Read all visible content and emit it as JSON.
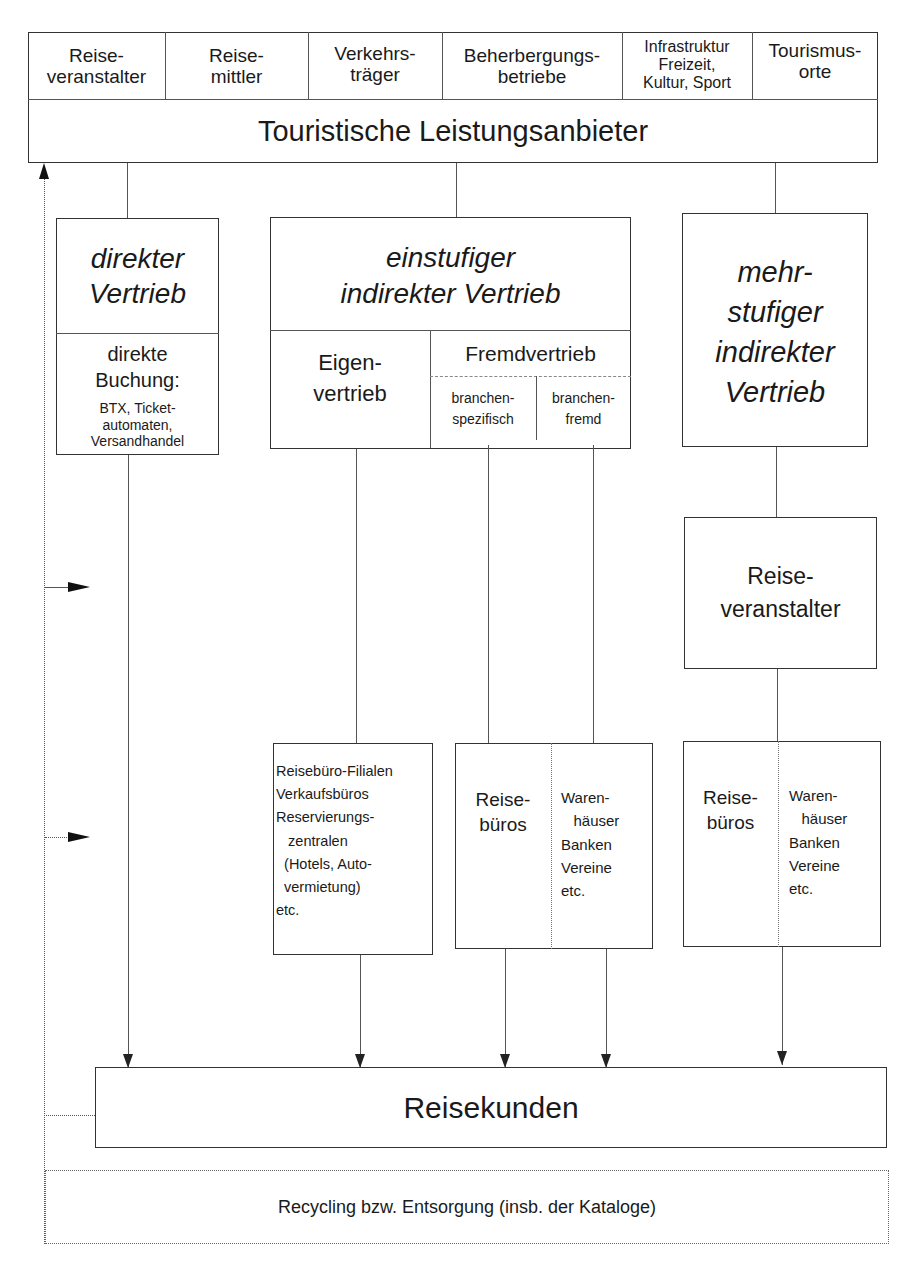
{
  "providers": {
    "title": "Touristische Leistungsanbieter",
    "categories": [
      {
        "label": "Reise-\nveranstalter"
      },
      {
        "label": "Reise-\nmittler"
      },
      {
        "label": "Verkehrs-\nträger"
      },
      {
        "label": "Beherbergungs-\nbetriebe"
      },
      {
        "label": "Infrastruktur\nFreizeit,\nKultur, Sport"
      },
      {
        "label": "Tourismus-\norte"
      }
    ]
  },
  "channels": {
    "direct": {
      "title": "direkter\nVertrieb",
      "subtitle": "direkte\nBuchung:",
      "detail": "BTX, Ticket-\nautomaten,\nVersandhandel"
    },
    "single_stage": {
      "title": "einstufiger\nindirekter Vertrieb",
      "own": "Eigen-\nvertrieb",
      "external": "Fremdvertrieb",
      "external_specific": "branchen-\nspezifisch",
      "external_foreign": "branchen-\nfremd"
    },
    "multi_stage": {
      "title": "mehr-\nstufiger\nindirekter\nVertrieb",
      "intermediary": "Reise-\nveranstalter"
    }
  },
  "outlets": {
    "own_outlets": "Reisebüro-Filialen\nVerkaufsbüros\nReservierungs-\n   zentralen\n  (Hotels, Auto-\n  vermietung)\netc.",
    "single_travel_agencies": "Reise-\nbüros",
    "single_other": "Waren-\n   häuser\nBanken\nVereine\netc.",
    "multi_travel_agencies": "Reise-\nbüros",
    "multi_other": "Waren-\n   häuser\nBanken\nVereine\netc."
  },
  "customers": {
    "label": "Reisekunden"
  },
  "recycling": {
    "label": "Recycling bzw. Entsorgung (insb. der Kataloge)"
  }
}
